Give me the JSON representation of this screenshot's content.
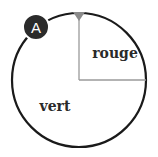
{
  "diagram": {
    "badge": {
      "label": "A",
      "color": "#2b2b2b"
    },
    "circle": {
      "stroke": "#1a1a1a",
      "fill": "#ffffff"
    },
    "marker": {
      "color": "#8a8a8a",
      "shape": "triangle-down"
    },
    "divider_color": "#9a9a9a",
    "sectors": [
      {
        "label": "rouge",
        "fraction": 0.25,
        "position": "top-right quadrant"
      },
      {
        "label": "vert",
        "fraction": 0.75,
        "position": "remaining"
      }
    ]
  }
}
